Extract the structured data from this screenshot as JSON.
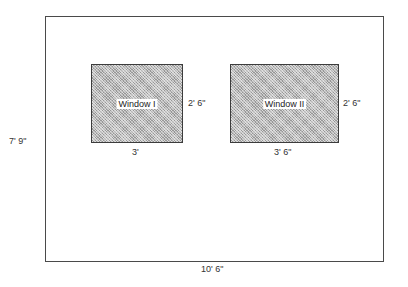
{
  "diagram": {
    "type": "wall-elevation-with-windows",
    "wall": {
      "width_label": "10' 6\"",
      "height_label": "7' 9\""
    },
    "windows": [
      {
        "label": "Window I",
        "width_label": "3'",
        "height_label": "2' 6\""
      },
      {
        "label": "Window II",
        "width_label": "3' 6\"",
        "height_label": "2' 6\""
      }
    ],
    "colors": {
      "wall_border": "#4a4a4a",
      "window_fill": "#b8b8b8",
      "window_border": "#3c3c3c",
      "label_background": "#ffffff",
      "text": "#333333"
    }
  }
}
